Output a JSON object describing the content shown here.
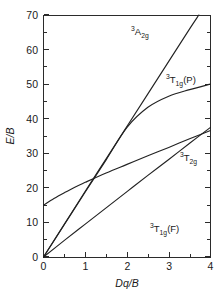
{
  "figure": {
    "background_color": "#ffffff",
    "line_color": "#222222",
    "axis_color": "#2b2b2b"
  },
  "axes": {
    "y_title": "E/B",
    "x_title": "Dq/B",
    "y_ticks": [
      "0",
      "10",
      "20",
      "30",
      "40",
      "50",
      "60",
      "70"
    ],
    "x_ticks": [
      "0",
      "1",
      "2",
      "3",
      "4"
    ]
  },
  "labels": {
    "a2g": {
      "super": "3",
      "base": "A",
      "sub": "2g",
      "tail": ""
    },
    "t1g_p": {
      "super": "3",
      "base": "T",
      "sub": "1g",
      "tail": "(P)"
    },
    "t2g": {
      "super": "3",
      "base": "T",
      "sub": "2g",
      "tail": ""
    },
    "t1g_f": {
      "super": "3",
      "base": "T",
      "sub": "1g",
      "tail": "(F)"
    }
  },
  "chart_data": {
    "type": "line",
    "title": "",
    "xlabel": "Dq/B",
    "ylabel": "E/B",
    "xlim": [
      0,
      4
    ],
    "ylim": [
      0,
      70
    ],
    "x_major_ticks": [
      0,
      1,
      2,
      3,
      4
    ],
    "x_minor_ticks": [
      0.5,
      1.5,
      2.5,
      3.5
    ],
    "y_major_ticks": [
      0,
      10,
      20,
      30,
      40,
      50,
      60,
      70
    ],
    "y_minor_ticks": [
      5,
      15,
      25,
      35,
      45,
      55,
      65
    ],
    "grid": false,
    "legend": "inline-annotations",
    "series": [
      {
        "name": "3T1g(F)",
        "label_text": "3T1g(F)",
        "x": [
          0,
          0.5,
          1.0,
          1.5,
          2.0,
          2.5,
          3.0,
          3.5,
          4.0
        ],
        "values": [
          0,
          4.8,
          9.5,
          14.2,
          18.9,
          23.6,
          28.2,
          32.9,
          37.5
        ]
      },
      {
        "name": "3T2g",
        "label_text": "3T2g",
        "x": [
          0,
          0.5,
          1.0,
          1.5,
          2.0,
          2.5,
          3.0,
          3.5,
          4.0
        ],
        "values": [
          0,
          9.4,
          18.8,
          28.1,
          37.5,
          43.3,
          46.5,
          48.4,
          50.0
        ]
      },
      {
        "name": "3A2g",
        "label_text": "3A2g",
        "x": [
          0,
          0.5,
          1.0,
          1.5,
          2.0,
          2.5,
          3.0,
          3.5,
          3.72
        ],
        "values": [
          0,
          9.5,
          19.0,
          28.4,
          37.8,
          47.2,
          56.6,
          66.0,
          70.0
        ]
      },
      {
        "name": "3T1g(P)",
        "label_text": "3T1g(P)",
        "x": [
          0,
          0.25,
          0.5,
          0.75,
          1.0,
          1.5,
          2.0,
          2.5,
          3.0,
          3.5,
          4.0
        ],
        "values": [
          15.0,
          16.9,
          18.6,
          20.2,
          21.6,
          24.3,
          26.8,
          29.3,
          31.7,
          34.2,
          36.6
        ]
      }
    ],
    "crossing_point": {
      "x": 1.26,
      "y": 25.0
    }
  }
}
